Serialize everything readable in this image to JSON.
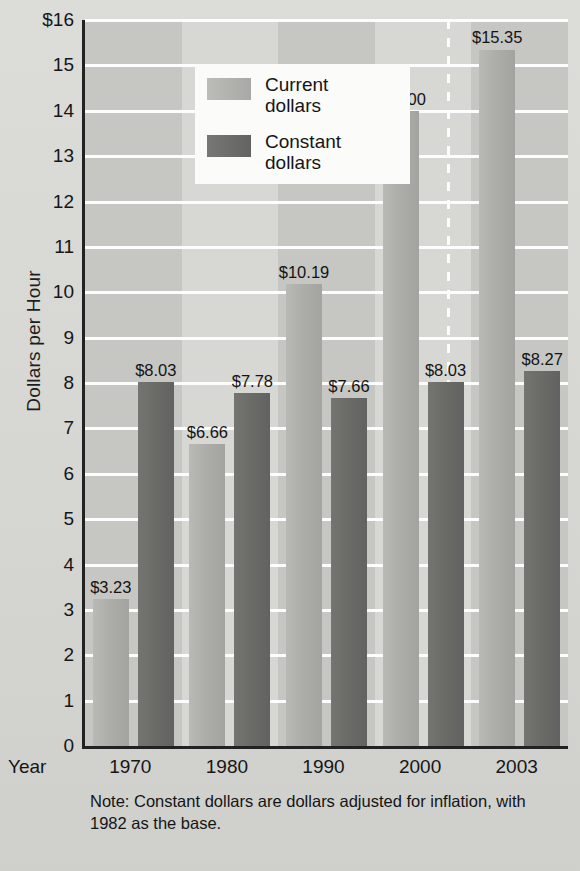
{
  "chart_data": {
    "type": "bar",
    "title": "",
    "xlabel": "Year",
    "ylabel": "Dollars per Hour",
    "categories": [
      "1970",
      "1980",
      "1990",
      "2000",
      "2003"
    ],
    "ylim": [
      0,
      16
    ],
    "yticks": [
      "0",
      "1",
      "2",
      "3",
      "4",
      "5",
      "6",
      "7",
      "8",
      "9",
      "10",
      "11",
      "12",
      "13",
      "14",
      "15",
      "$16"
    ],
    "grid": true,
    "legend_position": "top-left",
    "series": [
      {
        "name": "Current dollars",
        "color": "#adadaa",
        "values": [
          3.23,
          6.66,
          10.19,
          14.0,
          15.35
        ],
        "labels": [
          "$3.23",
          "$6.66",
          "$10.19",
          "$14.00",
          "$15.35"
        ]
      },
      {
        "name": "Constant dollars",
        "color": "#6b6b68",
        "values": [
          8.03,
          7.78,
          7.66,
          8.03,
          8.27
        ],
        "labels": [
          "$8.03",
          "$7.78",
          "$7.66",
          "$8.03",
          "$8.27"
        ]
      }
    ],
    "annotations": [
      "Note:  Constant dollars are dollars adjusted for inflation, with 1982 as the base."
    ]
  },
  "axis": {
    "y_title": "Dollars per Hour",
    "x_title": "Year"
  },
  "legend": {
    "items": [
      {
        "label_line1": "Current",
        "label_line2": "dollars"
      },
      {
        "label_line1": "Constant",
        "label_line2": "dollars"
      }
    ]
  },
  "note": {
    "line1": "Note:  Constant dollars are dollars adjusted for inflation,",
    "line2": "with 1982 as the base."
  }
}
